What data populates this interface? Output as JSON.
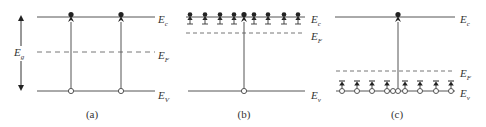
{
  "diagram": {
    "colors": {
      "line": "#555555",
      "dash": "#777777",
      "particle": "#222222"
    },
    "panels": [
      {
        "id": "a",
        "caption": "(a)",
        "gap_label": "E",
        "gap_sub": "g",
        "levels": {
          "ec": {
            "label": "E",
            "sub": "c"
          },
          "ef": {
            "label": "E",
            "sub": "F"
          },
          "ev": {
            "label": "E",
            "sub": "V"
          }
        },
        "transitions": 2
      },
      {
        "id": "b",
        "caption": "(b)",
        "levels": {
          "ec": {
            "label": "E",
            "sub": "c"
          },
          "ef": {
            "label": "E",
            "sub": "F"
          },
          "ev": {
            "label": "E",
            "sub": "v"
          }
        },
        "donor_count": 8,
        "transitions": 1
      },
      {
        "id": "c",
        "caption": "(c)",
        "levels": {
          "ec": {
            "label": "E",
            "sub": "c"
          },
          "ef": {
            "label": "E",
            "sub": "F"
          },
          "ev": {
            "label": "E",
            "sub": "v"
          }
        },
        "acceptor_count": 8,
        "transitions": 1
      }
    ]
  }
}
